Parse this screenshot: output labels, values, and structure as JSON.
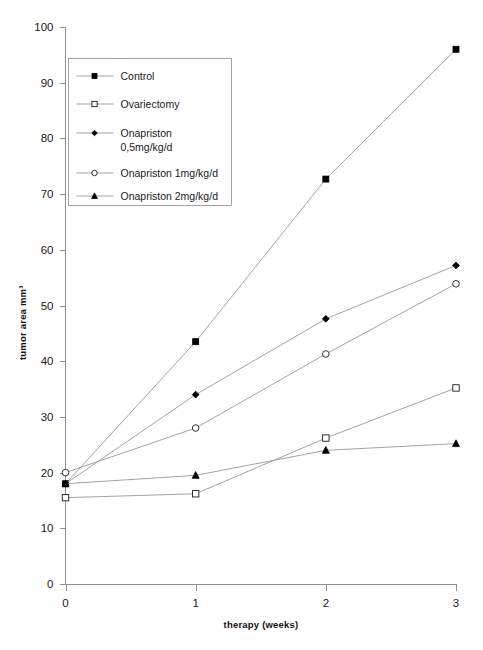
{
  "chart_data": {
    "type": "line",
    "title": "",
    "xlabel": "therapy (weeks)",
    "ylabel": "tumor area mm³",
    "x": [
      0,
      1,
      2,
      3
    ],
    "xticklabels": [
      "0",
      "1",
      "2",
      "3"
    ],
    "yticklabels": [
      "0",
      "10",
      "20",
      "30",
      "40",
      "50",
      "60",
      "70",
      "80",
      "90",
      "100"
    ],
    "yticks": [
      0,
      10,
      20,
      30,
      40,
      50,
      60,
      70,
      80,
      90,
      100
    ],
    "xlim": [
      0,
      3
    ],
    "ylim": [
      0,
      100
    ],
    "grid": false,
    "legend_position": "upper-left-inside",
    "series": [
      {
        "name": "Control",
        "marker": "filled-square",
        "values": [
          18.0,
          43.5,
          72.7,
          96.0
        ]
      },
      {
        "name": "Ovariectomy",
        "marker": "open-square",
        "values": [
          15.5,
          16.2,
          26.2,
          35.2
        ]
      },
      {
        "name": "Onapriston 0,5mg/kg/d",
        "marker": "filled-diamond",
        "values": [
          18.0,
          34.0,
          47.6,
          57.2
        ]
      },
      {
        "name": "Onapriston 1mg/kg/d",
        "marker": "open-circle",
        "values": [
          20.0,
          28.0,
          41.3,
          53.9
        ]
      },
      {
        "name": "Onapriston 2mg/kg/d",
        "marker": "filled-triangle",
        "values": [
          18.0,
          19.5,
          24.0,
          25.2
        ]
      }
    ]
  },
  "legend": {
    "entries": [
      {
        "label": "Control",
        "marker": "filled-square"
      },
      {
        "label": "Ovariectomy",
        "marker": "open-square"
      },
      {
        "label_line1": "Onapriston",
        "label_line2": "0,5mg/kg/d",
        "marker": "filled-diamond"
      },
      {
        "label": "Onapriston 1mg/kg/d",
        "marker": "open-circle"
      },
      {
        "label": "Onapriston 2mg/kg/d",
        "marker": "filled-triangle"
      }
    ]
  },
  "axes": {
    "y_title": "tumor area mm³",
    "x_title": "therapy (weeks)",
    "y_ticks": [
      "100",
      "90",
      "80",
      "70",
      "60",
      "50",
      "40",
      "30",
      "20",
      "10",
      "0"
    ],
    "x_ticks": [
      "0",
      "1",
      "2",
      "3"
    ]
  },
  "colors": {
    "background": "#ffffff",
    "axis": "#8e8e8e",
    "line": "#999999",
    "marker": "#000000",
    "text": "#1a1a1a"
  }
}
